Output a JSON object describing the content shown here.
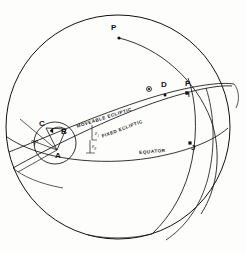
{
  "figure": {
    "type": "celestial-sphere-precession-diagram",
    "background": "#fdfdfc",
    "ink": "#111111",
    "width": 246,
    "height": 253
  },
  "sphere": {
    "outline_name": "celestial-sphere-outline",
    "center_x": 118,
    "center_y": 127,
    "radius": 112
  },
  "point_labels": [
    {
      "key": "P",
      "text": "P",
      "x": 114,
      "y": 28,
      "marker": true,
      "marker_x": 119,
      "marker_y": 38
    },
    {
      "key": "D",
      "text": "D",
      "x": 163,
      "y": 85,
      "marker": true,
      "marker_x": 165,
      "marker_y": 95
    },
    {
      "key": "R",
      "text": "P",
      "x": 187,
      "y": 84,
      "marker": true,
      "marker_x": 187,
      "marker_y": 93
    },
    {
      "key": "I",
      "text": "I",
      "x": 189,
      "y": 95,
      "marker": false,
      "marker_x": 0,
      "marker_y": 0
    },
    {
      "key": "J",
      "text": "J",
      "x": 193,
      "y": 147,
      "marker": true,
      "marker_x": 190,
      "marker_y": 143
    },
    {
      "key": "C",
      "text": "C",
      "x": 41,
      "y": 124,
      "marker": false,
      "marker_x": 0,
      "marker_y": 0
    },
    {
      "key": "B",
      "text": "B",
      "x": 63,
      "y": 133,
      "marker": false,
      "marker_x": 0,
      "marker_y": 0
    },
    {
      "key": "A",
      "text": "A",
      "x": 57,
      "y": 155,
      "marker": false,
      "marker_x": 0,
      "marker_y": 0
    }
  ],
  "aries_symbol": {
    "name": "aries-vernal-equinox-symbol",
    "text": "♈",
    "x": 33,
    "y": 137
  },
  "sun_symbol": {
    "name": "sun-node-symbol",
    "x": 149,
    "y": 89,
    "r": 2.4
  },
  "curve_labels": [
    {
      "key": "moveable_ecliptic",
      "text": "MOVEABLE ECLIPTIC",
      "x": 76,
      "y": 124,
      "rotate": -17.5
    },
    {
      "key": "fixed_ecliptic",
      "text": "FIXED ECLIPTIC",
      "x": 101,
      "y": 134,
      "rotate": -20.5
    },
    {
      "key": "equator",
      "text": "EQUATOR",
      "x": 139,
      "y": 150,
      "rotate": -4.5
    }
  ],
  "angle_labels": [
    {
      "key": "eps1",
      "base": "ε",
      "sub": "1",
      "x": 95,
      "y": 133
    },
    {
      "key": "eps0",
      "base": "ε",
      "sub": "0",
      "x": 92,
      "y": 146
    }
  ],
  "strokes": {
    "sphere_outline": 1.0,
    "great_circle": 0.85,
    "inset_circle": 0.85,
    "thin": 0.7
  }
}
